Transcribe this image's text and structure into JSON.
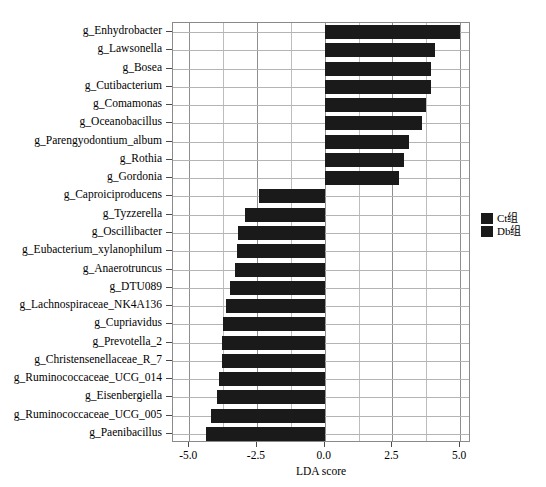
{
  "chart_data": {
    "type": "bar",
    "orientation": "horizontal",
    "title": "",
    "xlabel": "LDA score",
    "ylabel": "",
    "xlim": [
      -5.6,
      5.4
    ],
    "xticks": [
      -5.0,
      -2.5,
      0.0,
      2.5,
      5.0
    ],
    "xticklabels": [
      "-5.0",
      "-2.5",
      "0.0",
      "2.5",
      "5.0"
    ],
    "grid": true,
    "legend_position": "right",
    "categories": [
      "g_Enhydrobacter",
      "g_Lawsonella",
      "g_Bosea",
      "g_Cutibacterium",
      "g_Comamonas",
      "g_Oceanobacillus",
      "g_Parengyodontium_album",
      "g_Rothia",
      "g_Gordonia",
      "g_Caproiciproducens",
      "g_Tyzzerella",
      "g_Oscillibacter",
      "g_Eubacterium_xylanophilum",
      "g_Anaerotruncus",
      "g_DTU089",
      "g_Lachnospiraceae_NK4A136",
      "g_Cupriavidus",
      "g_Prevotella_2",
      "g_Christensenellaceae_R_7",
      "g_Ruminococcaceae_UCG_014",
      "g_Eisenbergiella",
      "g_Ruminococcaceae_UCG_005",
      "g_Paenibacillus"
    ],
    "values": [
      5.0,
      4.08,
      3.94,
      3.91,
      3.73,
      3.59,
      3.13,
      2.92,
      2.75,
      -2.43,
      -2.96,
      -3.2,
      -3.24,
      -3.31,
      -3.49,
      -3.63,
      -3.77,
      -3.8,
      -3.8,
      -3.91,
      -3.98,
      -4.19,
      -4.4
    ],
    "groups": [
      "Ct组",
      "Ct组",
      "Ct组",
      "Ct组",
      "Ct组",
      "Ct组",
      "Ct组",
      "Ct组",
      "Ct组",
      "Db组",
      "Db组",
      "Db组",
      "Db组",
      "Db组",
      "Db组",
      "Db组",
      "Db组",
      "Db组",
      "Db组",
      "Db组",
      "Db组",
      "Db组",
      "Db组"
    ],
    "bar_color": "#1a1a1a"
  },
  "legend": {
    "entries": [
      {
        "label": "Ct组",
        "color": "#1a1a1a"
      },
      {
        "label": "Db组",
        "color": "#1a1a1a"
      }
    ]
  }
}
